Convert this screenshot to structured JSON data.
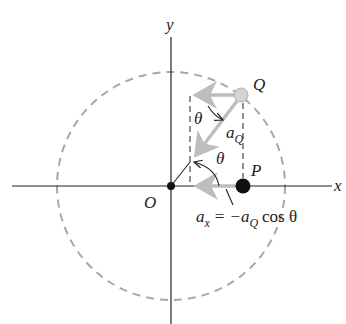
{
  "diagram": {
    "type": "uniform circular motion projection",
    "axes": {
      "x_label": "x",
      "y_label": "y"
    },
    "points": {
      "origin": {
        "label": "O"
      },
      "Q": {
        "label": "Q"
      },
      "P": {
        "label": "P"
      }
    },
    "angle_labels": {
      "theta_top": "θ",
      "theta_mid": "θ"
    },
    "vectors": {
      "aQ": {
        "symbol": "a",
        "subscript": "Q"
      }
    },
    "equation": {
      "lhs_symbol": "a",
      "lhs_subscript": "x",
      "equals": "=",
      "rhs_prefix": "−a",
      "rhs_subscript": "Q",
      "rhs_suffix": "cos θ"
    },
    "colors": {
      "axis": "#222222",
      "circle_dashed": "#a8a8a8",
      "gray_arrow": "#bdbdbd",
      "q_fill": "#d4d4d4",
      "p_fill": "#111111"
    }
  }
}
